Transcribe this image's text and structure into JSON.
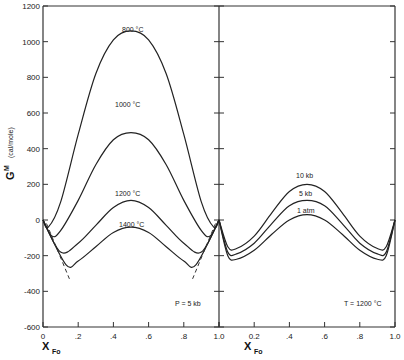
{
  "chart_data": {
    "type": "line",
    "title": "",
    "ylabel": "G^M (cal/mole)",
    "ylabel_main": "G",
    "ylabel_sup": "M",
    "ylabel_units": "(cal/mole)",
    "ylim": [
      -600,
      1200
    ],
    "yticks": [
      1200,
      1000,
      800,
      600,
      400,
      200,
      0,
      -200,
      -400,
      -600
    ],
    "ytick_labels": [
      "1200",
      "1000",
      "800",
      "600",
      "400",
      "200",
      "0",
      "-200",
      "-400",
      "-600"
    ],
    "panels": [
      {
        "name": "left",
        "xlabel": "X_Fo",
        "xlabel_main": "X",
        "xlabel_sub": "Fo",
        "xlim": [
          0,
          1
        ],
        "xtick_labels": [
          "0",
          ".2",
          ".4",
          ".6",
          ".8",
          "1.0"
        ],
        "annotation": "P = 5 kb",
        "series": [
          {
            "name": "800 °C",
            "x": [
              0,
              0.03,
              0.1,
              0.2,
              0.3,
              0.4,
              0.5,
              0.6,
              0.7,
              0.8,
              0.9,
              0.97,
              1.0
            ],
            "y": [
              0,
              -40,
              100,
              480,
              820,
              1010,
              1060,
              1010,
              820,
              480,
              100,
              -40,
              0
            ]
          },
          {
            "name": "1000 °C",
            "x": [
              0,
              0.05,
              0.1,
              0.2,
              0.3,
              0.4,
              0.5,
              0.6,
              0.7,
              0.8,
              0.9,
              0.95,
              1.0
            ],
            "y": [
              0,
              -90,
              -60,
              110,
              310,
              450,
              490,
              450,
              310,
              110,
              -60,
              -90,
              0
            ]
          },
          {
            "name": "1200 °C",
            "x": [
              0,
              0.1,
              0.2,
              0.3,
              0.4,
              0.5,
              0.6,
              0.7,
              0.8,
              0.9,
              1.0
            ],
            "y": [
              0,
              -180,
              -130,
              -30,
              70,
              110,
              70,
              -30,
              -130,
              -180,
              0
            ]
          },
          {
            "name": "1400 °C",
            "x": [
              0,
              0.13,
              0.2,
              0.3,
              0.4,
              0.5,
              0.6,
              0.7,
              0.8,
              0.87,
              1.0
            ],
            "y": [
              0,
              -250,
              -230,
              -150,
              -70,
              -40,
              -70,
              -150,
              -230,
              -250,
              0
            ]
          }
        ],
        "dashed_lines": [
          {
            "name": "left-solvus",
            "x": [
              0.02,
              0.15
            ],
            "y": [
              -20,
              -330
            ]
          },
          {
            "name": "right-solvus",
            "x": [
              0.98,
              0.85
            ],
            "y": [
              -20,
              -330
            ]
          }
        ]
      },
      {
        "name": "right",
        "xlabel": "X_Fo",
        "xlabel_main": "X",
        "xlabel_sub": "Fo",
        "xlim": [
          0,
          1
        ],
        "xtick_labels": [
          "1.0",
          "0.2",
          ".4",
          ".6",
          ".8",
          "1.0"
        ],
        "annotation": "T = 1200 °C",
        "series": [
          {
            "name": "10 kb",
            "x": [
              0,
              0.05,
              0.1,
              0.2,
              0.3,
              0.4,
              0.5,
              0.6,
              0.7,
              0.8,
              0.9,
              0.95,
              1.0
            ],
            "y": [
              0,
              -150,
              -160,
              -90,
              40,
              160,
              200,
              160,
              40,
              -90,
              -160,
              -150,
              0
            ]
          },
          {
            "name": "5 kb",
            "x": [
              0,
              0.05,
              0.1,
              0.2,
              0.3,
              0.4,
              0.5,
              0.6,
              0.7,
              0.8,
              0.9,
              0.95,
              1.0
            ],
            "y": [
              0,
              -180,
              -190,
              -130,
              -20,
              80,
              110,
              80,
              -20,
              -130,
              -190,
              -180,
              0
            ]
          },
          {
            "name": "1 atm",
            "x": [
              0,
              0.05,
              0.1,
              0.2,
              0.3,
              0.4,
              0.5,
              0.6,
              0.7,
              0.8,
              0.9,
              0.95,
              1.0
            ],
            "y": [
              0,
              -200,
              -220,
              -170,
              -80,
              0,
              30,
              0,
              -80,
              -170,
              -220,
              -200,
              0
            ]
          }
        ]
      }
    ],
    "grid": false,
    "legend": "inline curve labels"
  },
  "labels": {
    "c800": "800 °C",
    "c1000": "1000 °C",
    "c1200": "1200 °C",
    "c1400": "1400 °C",
    "p10": "10 kb",
    "p5": "5 kb",
    "p1": "1 atm",
    "left_annot": "P = 5 kb",
    "right_annot": "T = 1200 °C"
  }
}
